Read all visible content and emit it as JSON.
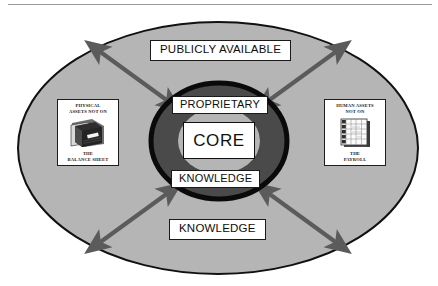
{
  "diagram": {
    "type": "concentric-ellipse-radial",
    "colors": {
      "outer_ellipse_fill": "#b5b5b5",
      "outer_ellipse_stroke": "#111111",
      "inner_ring_fill": "#4a4a4a",
      "inner_ring_stroke": "#0a0a0a",
      "inner_core_halo_fill": "#b5b5b5",
      "arrow_color": "#5b5b5b",
      "plate_fill": "#ffffff",
      "plate_stroke": "#1a1a1a",
      "text_color": "#0d0d0d",
      "top_rule": "#9a9a9a"
    }
  },
  "banners": {
    "top": "PUBLICLY AVAILABLE",
    "bottom": "KNOWLEDGE"
  },
  "core": {
    "label_above": "PROPRIETARY",
    "center_label": "CORE",
    "label_below": "KNOWLEDGE"
  },
  "assets": {
    "left": {
      "caption_top": "PHYSICAL\nASSETS NOT ON",
      "caption_bottom": "THE\nBALANCE SHEET",
      "icon": "ledger-book-icon"
    },
    "right": {
      "caption_top": "HUMAN ASSETS\nNOT ON",
      "caption_bottom": "THE\nPAYROLL",
      "icon": "spreadsheet-grid-icon"
    }
  },
  "arrows": [
    {
      "name": "arrow-up-left",
      "direction": "double-headed",
      "from": "core",
      "to": "upper-left-region"
    },
    {
      "name": "arrow-up-right",
      "direction": "double-headed",
      "from": "core",
      "to": "upper-right-region"
    },
    {
      "name": "arrow-down-left",
      "direction": "double-headed",
      "from": "core",
      "to": "lower-left-region"
    },
    {
      "name": "arrow-down-right",
      "direction": "double-headed",
      "from": "core",
      "to": "lower-right-region"
    }
  ]
}
